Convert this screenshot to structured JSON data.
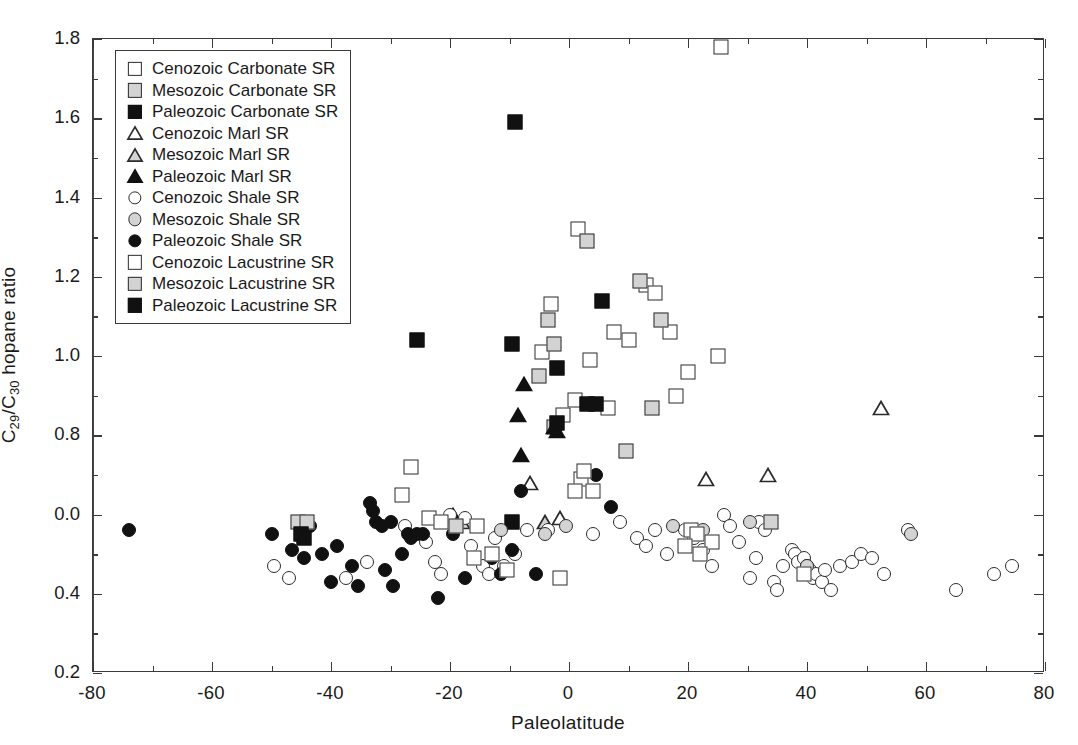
{
  "chart_data": {
    "type": "scatter",
    "title": "",
    "xlabel": "Paleolatitude",
    "ylabel": "C29/C30 hopane ratio",
    "ylabel_parts": {
      "pre": "C",
      "sub1": "29",
      "mid": "/C",
      "sub2": "30",
      "post": " hopane ratio"
    },
    "xlim": [
      -80,
      80
    ],
    "ylim": [
      0.2,
      1.8
    ],
    "xticks": [
      -80,
      -60,
      -40,
      -20,
      0,
      20,
      40,
      60,
      80
    ],
    "xticklabels": [
      "-80",
      "-60",
      "-40",
      "-20",
      "0",
      "20",
      "40",
      "60",
      "80"
    ],
    "xminor_step": 10,
    "yticks": [
      0.2,
      0.4,
      0.6,
      0.8,
      1.0,
      1.2,
      1.4,
      1.6,
      1.8
    ],
    "yticklabels": [
      "0.2",
      "0.4",
      "0.0",
      "0.8",
      "1.0",
      "1.2",
      "1.4",
      "1.6",
      "1.8"
    ],
    "yminor_step": 0.1,
    "grid": false,
    "legend_position": "upper-left",
    "annotations": [
      {
        "kind": "vertical-line",
        "x": 0,
        "note": "equator reference line"
      }
    ],
    "series": [
      {
        "name": "Cenozoic Carbonate SR",
        "marker": "square",
        "fill": "open",
        "points": [
          [
            25.5,
            1.78
          ],
          [
            1.5,
            1.32
          ],
          [
            -3.0,
            1.13
          ],
          [
            13.0,
            1.18
          ],
          [
            14.5,
            1.16
          ],
          [
            7.5,
            1.06
          ],
          [
            17.0,
            1.06
          ],
          [
            10.0,
            1.04
          ],
          [
            20.0,
            0.96
          ],
          [
            25.0,
            1.0
          ],
          [
            18.0,
            0.9
          ],
          [
            3.5,
            0.99
          ],
          [
            1.0,
            0.89
          ],
          [
            -4.5,
            1.01
          ],
          [
            6.5,
            0.87
          ],
          [
            -1.0,
            0.85
          ],
          [
            2.0,
            0.69
          ],
          [
            1.0,
            0.66
          ]
        ]
      },
      {
        "name": "Mesozoic Carbonate SR",
        "marker": "square",
        "fill": "half",
        "points": [
          [
            -3.5,
            1.09
          ],
          [
            3.0,
            1.29
          ],
          [
            12.0,
            1.19
          ],
          [
            15.5,
            1.09
          ],
          [
            -2.5,
            1.03
          ],
          [
            -5.0,
            0.95
          ],
          [
            -2.5,
            0.82
          ],
          [
            14.0,
            0.87
          ],
          [
            9.5,
            0.76
          ]
        ]
      },
      {
        "name": "Paleozoic Carbonate SR",
        "marker": "square",
        "fill": "fill",
        "points": [
          [
            -9.0,
            1.59
          ],
          [
            -25.5,
            1.04
          ],
          [
            -9.5,
            1.03
          ],
          [
            5.5,
            1.14
          ],
          [
            -2.0,
            0.97
          ],
          [
            3.0,
            0.88
          ],
          [
            4.5,
            0.88
          ],
          [
            -2.0,
            0.83
          ],
          [
            -9.5,
            0.58
          ]
        ]
      },
      {
        "name": "Cenozoic Marl SR",
        "marker": "triangle",
        "fill": "open",
        "points": [
          [
            33.5,
            0.7
          ],
          [
            52.5,
            0.87
          ],
          [
            -6.5,
            0.68
          ],
          [
            -1.5,
            0.59
          ],
          [
            23.0,
            0.69
          ]
        ]
      },
      {
        "name": "Mesozoic Marl SR",
        "marker": "triangle",
        "fill": "half",
        "points": [
          [
            -4.0,
            0.58
          ],
          [
            -18.0,
            0.58
          ]
        ]
      },
      {
        "name": "Paleozoic Marl SR",
        "marker": "triangle",
        "fill": "fill",
        "points": [
          [
            -7.5,
            0.93
          ],
          [
            -8.5,
            0.85
          ],
          [
            -8.0,
            0.75
          ],
          [
            -2.5,
            0.82
          ],
          [
            -2.0,
            0.81
          ],
          [
            -19.5,
            0.6
          ]
        ]
      },
      {
        "name": "Cenozoic Shale SR",
        "marker": "circle",
        "fill": "open",
        "points": [
          [
            -49.5,
            0.47
          ],
          [
            -47.0,
            0.44
          ],
          [
            -37.5,
            0.44
          ],
          [
            -34.0,
            0.48
          ],
          [
            -24.0,
            0.53
          ],
          [
            -22.5,
            0.48
          ],
          [
            -21.5,
            0.45
          ],
          [
            -20.0,
            0.6
          ],
          [
            -17.5,
            0.59
          ],
          [
            -16.5,
            0.52
          ],
          [
            -14.5,
            0.47
          ],
          [
            -13.5,
            0.45
          ],
          [
            -12.5,
            0.54
          ],
          [
            -11.0,
            0.47
          ],
          [
            -9.0,
            0.5
          ],
          [
            -7.0,
            0.56
          ],
          [
            -3.5,
            0.56
          ],
          [
            4.0,
            0.55
          ],
          [
            8.5,
            0.58
          ],
          [
            11.5,
            0.54
          ],
          [
            13.0,
            0.52
          ],
          [
            14.5,
            0.56
          ],
          [
            16.5,
            0.5
          ],
          [
            19.5,
            0.56
          ],
          [
            21.0,
            0.54
          ],
          [
            22.5,
            0.51
          ],
          [
            24.0,
            0.47
          ],
          [
            26.0,
            0.6
          ],
          [
            27.0,
            0.57
          ],
          [
            28.5,
            0.53
          ],
          [
            30.5,
            0.44
          ],
          [
            31.5,
            0.49
          ],
          [
            32.0,
            0.58
          ],
          [
            33.0,
            0.56
          ],
          [
            34.5,
            0.43
          ],
          [
            35.0,
            0.41
          ],
          [
            36.0,
            0.47
          ],
          [
            37.5,
            0.51
          ],
          [
            38.0,
            0.5
          ],
          [
            38.5,
            0.48
          ],
          [
            39.5,
            0.49
          ],
          [
            40.0,
            0.47
          ],
          [
            40.5,
            0.46
          ],
          [
            41.0,
            0.44
          ],
          [
            41.5,
            0.45
          ],
          [
            42.5,
            0.43
          ],
          [
            43.0,
            0.46
          ],
          [
            44.0,
            0.41
          ],
          [
            45.5,
            0.47
          ],
          [
            47.5,
            0.48
          ],
          [
            49.0,
            0.5
          ],
          [
            51.0,
            0.49
          ],
          [
            53.0,
            0.45
          ],
          [
            57.0,
            0.56
          ],
          [
            65.0,
            0.41
          ],
          [
            71.5,
            0.45
          ],
          [
            74.5,
            0.47
          ],
          [
            -27.5,
            0.57
          ]
        ]
      },
      {
        "name": "Mesozoic Shale SR",
        "marker": "circle",
        "fill": "half",
        "points": [
          [
            -11.5,
            0.56
          ],
          [
            -0.5,
            0.57
          ],
          [
            -4.0,
            0.55
          ],
          [
            17.5,
            0.57
          ],
          [
            40.0,
            0.47
          ],
          [
            57.5,
            0.55
          ],
          [
            30.5,
            0.58
          ],
          [
            22.5,
            0.56
          ]
        ]
      },
      {
        "name": "Paleozoic Shale SR",
        "marker": "circle",
        "fill": "fill",
        "points": [
          [
            -74.0,
            0.56
          ],
          [
            -50.0,
            0.55
          ],
          [
            -46.5,
            0.51
          ],
          [
            -44.5,
            0.49
          ],
          [
            -41.5,
            0.5
          ],
          [
            -40.0,
            0.43
          ],
          [
            -39.0,
            0.52
          ],
          [
            -36.5,
            0.47
          ],
          [
            -35.5,
            0.42
          ],
          [
            -33.5,
            0.63
          ],
          [
            -33.0,
            0.61
          ],
          [
            -32.5,
            0.58
          ],
          [
            -31.5,
            0.57
          ],
          [
            -30.0,
            0.58
          ],
          [
            -29.5,
            0.42
          ],
          [
            -28.0,
            0.5
          ],
          [
            -27.0,
            0.55
          ],
          [
            -26.5,
            0.54
          ],
          [
            -25.5,
            0.55
          ],
          [
            -24.5,
            0.55
          ],
          [
            -22.0,
            0.39
          ],
          [
            -19.5,
            0.55
          ],
          [
            -17.5,
            0.44
          ],
          [
            -13.0,
            0.49
          ],
          [
            -9.5,
            0.51
          ],
          [
            -8.0,
            0.66
          ],
          [
            -5.5,
            0.45
          ],
          [
            7.0,
            0.62
          ],
          [
            4.5,
            0.7
          ],
          [
            -43.5,
            0.57
          ],
          [
            -31.0,
            0.46
          ],
          [
            -11.5,
            0.45
          ]
        ]
      },
      {
        "name": "Cenozoic Lacustrine SR",
        "marker": "diamond",
        "fill": "open",
        "points": [
          [
            -26.5,
            0.72
          ],
          [
            -28.0,
            0.65
          ],
          [
            -23.5,
            0.59
          ],
          [
            -15.5,
            0.57
          ],
          [
            -13.0,
            0.5
          ],
          [
            -10.5,
            0.46
          ],
          [
            2.5,
            0.71
          ],
          [
            4.0,
            0.66
          ],
          [
            -1.5,
            0.44
          ],
          [
            20.5,
            0.56
          ],
          [
            21.5,
            0.55
          ],
          [
            24.0,
            0.53
          ],
          [
            22.0,
            0.5
          ],
          [
            19.5,
            0.52
          ],
          [
            39.5,
            0.45
          ],
          [
            -21.5,
            0.58
          ],
          [
            -16.0,
            0.49
          ]
        ]
      },
      {
        "name": "Mesozoic Lacustrine SR",
        "marker": "diamond",
        "fill": "half",
        "points": [
          [
            -45.5,
            0.58
          ],
          [
            -44.0,
            0.58
          ],
          [
            -19.0,
            0.57
          ],
          [
            34.0,
            0.58
          ]
        ]
      },
      {
        "name": "Paleozoic Lacustrine SR",
        "marker": "diamond",
        "fill": "fill",
        "points": [
          [
            -45.0,
            0.55
          ],
          [
            -44.5,
            0.54
          ]
        ]
      }
    ]
  },
  "legend": {
    "items": [
      {
        "label": "Cenozoic Carbonate SR",
        "marker": "square",
        "fill": "open"
      },
      {
        "label": "Mesozoic Carbonate SR",
        "marker": "square",
        "fill": "half"
      },
      {
        "label": "Paleozoic Carbonate SR",
        "marker": "square",
        "fill": "fill"
      },
      {
        "label": "Cenozoic Marl SR",
        "marker": "triangle",
        "fill": "open"
      },
      {
        "label": "Mesozoic Marl SR",
        "marker": "triangle",
        "fill": "half"
      },
      {
        "label": "Paleozoic Marl SR",
        "marker": "triangle",
        "fill": "fill"
      },
      {
        "label": "Cenozoic Shale SR",
        "marker": "circle",
        "fill": "open"
      },
      {
        "label": "Mesozoic Shale SR",
        "marker": "circle",
        "fill": "half"
      },
      {
        "label": "Paleozoic Shale SR",
        "marker": "circle",
        "fill": "fill"
      },
      {
        "label": "Cenozoic Lacustrine SR",
        "marker": "diamond",
        "fill": "open"
      },
      {
        "label": "Mesozoic Lacustrine SR",
        "marker": "diamond",
        "fill": "half"
      },
      {
        "label": "Paleozoic Lacustrine SR",
        "marker": "diamond",
        "fill": "fill"
      }
    ]
  },
  "colors": {
    "axis": "#3a3a3a",
    "marker_stroke": "#2b2b2b",
    "fill_open": "#ffffff",
    "fill_half": "#d3d3d3",
    "fill_solid": "#111111",
    "text": "#1a1a1a",
    "background": "#ffffff"
  }
}
